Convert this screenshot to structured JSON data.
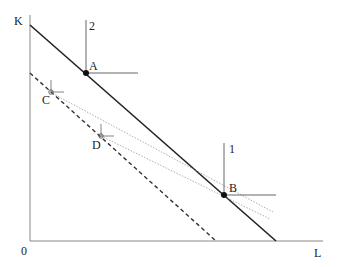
{
  "diagram": {
    "axes": {
      "y_label": "K",
      "x_label": "L",
      "origin_label": "0"
    },
    "points": [
      {
        "id": "A",
        "label": "A",
        "x": 86,
        "y": 73,
        "marker": "filled",
        "axis_label": "2"
      },
      {
        "id": "B",
        "label": "B",
        "x": 224,
        "y": 195,
        "marker": "filled",
        "axis_label": "1"
      },
      {
        "id": "C",
        "label": "C",
        "x": 50,
        "y": 92,
        "marker": "open"
      },
      {
        "id": "D",
        "label": "D",
        "x": 101,
        "y": 136,
        "marker": "open"
      }
    ],
    "lines": [
      {
        "id": "isocost-solid",
        "style": "solid",
        "from": [
          30,
          25
        ],
        "to": [
          276,
          241
        ]
      },
      {
        "id": "isocost-dashed",
        "style": "dashed",
        "from": [
          30,
          73
        ],
        "to": [
          216,
          241
        ]
      },
      {
        "id": "ray-C-B",
        "style": "dotted",
        "from": [
          50,
          92
        ],
        "to": [
          273,
          212
        ]
      },
      {
        "id": "ray-D-B",
        "style": "dotted",
        "from": [
          101,
          136
        ],
        "to": [
          270,
          219
        ]
      }
    ],
    "colors": {
      "line": "#222222",
      "axis": "#777777",
      "dotted": "#888888"
    }
  }
}
